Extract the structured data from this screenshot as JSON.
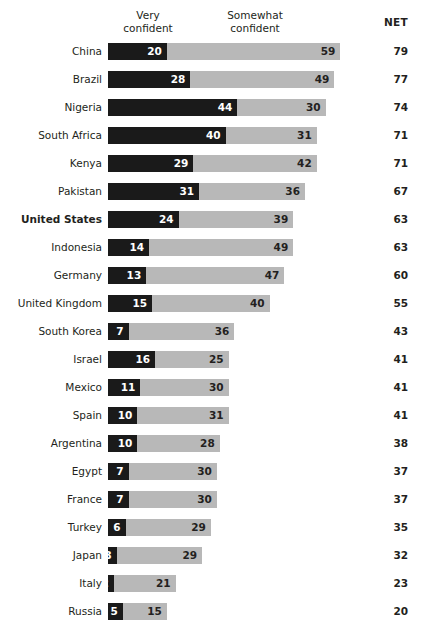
{
  "header": {
    "very_label": "Very\nconfident",
    "somewhat_label": "Somewhat\nconfident",
    "net_label": "NET"
  },
  "chart_data": {
    "type": "bar",
    "subtype": "stacked-horizontal",
    "title": "",
    "xlabel": "",
    "ylabel": "",
    "grid": false,
    "legend_position": "top",
    "axis_hidden": true,
    "xlim": [
      0,
      79
    ],
    "px_per_unit": 2.94,
    "bar_start_x": 108,
    "categories": [
      "China",
      "Brazil",
      "Nigeria",
      "South Africa",
      "Kenya",
      "Pakistan",
      "United States",
      "Indonesia",
      "Germany",
      "United Kingdom",
      "South Korea",
      "Israel",
      "Mexico",
      "Spain",
      "Argentina",
      "Egypt",
      "France",
      "Turkey",
      "Japan",
      "Italy",
      "Russia"
    ],
    "series": [
      {
        "name": "Very confident",
        "color": "#1a1a1a",
        "values": [
          20,
          28,
          44,
          40,
          29,
          31,
          24,
          14,
          13,
          15,
          7,
          16,
          11,
          10,
          10,
          7,
          7,
          6,
          3,
          2,
          5
        ]
      },
      {
        "name": "Somewhat confident",
        "color": "#b8b8b8",
        "values": [
          59,
          49,
          30,
          31,
          42,
          36,
          39,
          49,
          47,
          40,
          36,
          25,
          30,
          31,
          28,
          30,
          30,
          29,
          29,
          21,
          15
        ]
      }
    ],
    "net": [
      79,
      77,
      74,
      71,
      71,
      67,
      63,
      63,
      60,
      55,
      43,
      41,
      41,
      41,
      38,
      37,
      37,
      35,
      32,
      23,
      20
    ],
    "highlight_category": "United States",
    "rows": [
      {
        "label": "China",
        "very": 20,
        "somewhat": 59,
        "net": 79,
        "highlight": false
      },
      {
        "label": "Brazil",
        "very": 28,
        "somewhat": 49,
        "net": 77,
        "highlight": false
      },
      {
        "label": "Nigeria",
        "very": 44,
        "somewhat": 30,
        "net": 74,
        "highlight": false
      },
      {
        "label": "South Africa",
        "very": 40,
        "somewhat": 31,
        "net": 71,
        "highlight": false
      },
      {
        "label": "Kenya",
        "very": 29,
        "somewhat": 42,
        "net": 71,
        "highlight": false
      },
      {
        "label": "Pakistan",
        "very": 31,
        "somewhat": 36,
        "net": 67,
        "highlight": false
      },
      {
        "label": "United States",
        "very": 24,
        "somewhat": 39,
        "net": 63,
        "highlight": true
      },
      {
        "label": "Indonesia",
        "very": 14,
        "somewhat": 49,
        "net": 63,
        "highlight": false
      },
      {
        "label": "Germany",
        "very": 13,
        "somewhat": 47,
        "net": 60,
        "highlight": false
      },
      {
        "label": "United Kingdom",
        "very": 15,
        "somewhat": 40,
        "net": 55,
        "highlight": false
      },
      {
        "label": "South Korea",
        "very": 7,
        "somewhat": 36,
        "net": 43,
        "highlight": false
      },
      {
        "label": "Israel",
        "very": 16,
        "somewhat": 25,
        "net": 41,
        "highlight": false
      },
      {
        "label": "Mexico",
        "very": 11,
        "somewhat": 30,
        "net": 41,
        "highlight": false
      },
      {
        "label": "Spain",
        "very": 10,
        "somewhat": 31,
        "net": 41,
        "highlight": false
      },
      {
        "label": "Argentina",
        "very": 10,
        "somewhat": 28,
        "net": 38,
        "highlight": false
      },
      {
        "label": "Egypt",
        "very": 7,
        "somewhat": 30,
        "net": 37,
        "highlight": false
      },
      {
        "label": "France",
        "very": 7,
        "somewhat": 30,
        "net": 37,
        "highlight": false
      },
      {
        "label": "Turkey",
        "very": 6,
        "somewhat": 29,
        "net": 35,
        "highlight": false
      },
      {
        "label": "Japan",
        "very": 3,
        "somewhat": 29,
        "net": 32,
        "highlight": false
      },
      {
        "label": "Italy",
        "very": 2,
        "somewhat": 21,
        "net": 23,
        "highlight": false
      },
      {
        "label": "Russia",
        "very": 5,
        "somewhat": 15,
        "net": 20,
        "highlight": false
      }
    ]
  }
}
